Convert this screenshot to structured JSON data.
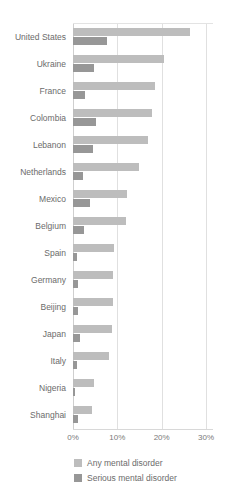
{
  "chart_data": {
    "type": "bar",
    "orientation": "horizontal",
    "title": "",
    "xlabel": "",
    "ylabel": "",
    "xlim": [
      0,
      30
    ],
    "xunit": "%",
    "grid": true,
    "legend_position": "bottom",
    "xticks": [
      "0%",
      "10%",
      "20%",
      "30%"
    ],
    "xtick_values": [
      0,
      10,
      20,
      30
    ],
    "categories": [
      "United States",
      "Ukraine",
      "France",
      "Colombia",
      "Lebanon",
      "Netherlands",
      "Mexico",
      "Belgium",
      "Spain",
      "Germany",
      "Beijing",
      "Japan",
      "Italy",
      "Nigeria",
      "Shanghai"
    ],
    "series": [
      {
        "name": "Any mental disorder",
        "color": "#bdbdbd",
        "values": [
          26.4,
          20.5,
          18.4,
          17.8,
          16.9,
          14.9,
          12.2,
          12.0,
          9.2,
          9.1,
          9.1,
          8.8,
          8.2,
          4.7,
          4.3
        ]
      },
      {
        "name": "Serious mental disorder",
        "color": "#979797",
        "values": [
          7.7,
          4.8,
          2.7,
          5.2,
          4.6,
          2.3,
          3.8,
          2.4,
          1.0,
          1.2,
          1.1,
          1.5,
          1.0,
          0.4,
          1.1
        ]
      }
    ]
  },
  "legend": {
    "items": [
      {
        "label": "Any mental disorder",
        "color": "#bdbdbd"
      },
      {
        "label": "Serious mental disorder",
        "color": "#979797"
      }
    ]
  }
}
